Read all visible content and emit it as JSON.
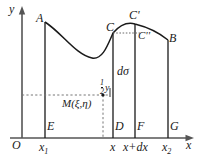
{
  "figure": {
    "axes": {
      "x_label": "x",
      "y_label": "y",
      "origin_label": "O"
    },
    "curve_points": [
      {
        "label": "A",
        "x": 45,
        "y": 22
      },
      {
        "label": "C",
        "x": 113,
        "y": 33
      },
      {
        "label": "C'",
        "x": 135,
        "y": 24
      },
      {
        "label": "C''",
        "x": 141,
        "y": 37
      },
      {
        "label": "B",
        "x": 168,
        "y": 40
      }
    ],
    "base_points": [
      {
        "label": "E",
        "x": 45
      },
      {
        "label": "D",
        "x": 113
      },
      {
        "label": "F",
        "x": 135
      },
      {
        "label": "G",
        "x": 168
      }
    ],
    "tick_labels": [
      {
        "text": "x1",
        "x": 45
      },
      {
        "text": "x",
        "x": 113
      },
      {
        "text": "x+dx",
        "x": 140
      },
      {
        "text": "x2",
        "x": 168
      }
    ],
    "annotations": {
      "area_element": "dσ",
      "midpoint": "M(ξ,η)",
      "half_y_numerator": "1",
      "half_y_denominator": "2",
      "half_y_variable": "y"
    },
    "colors": {
      "stroke": "#1a1a1a",
      "axis": "#555555",
      "dashed": "#777777",
      "background": "#ffffff"
    }
  }
}
